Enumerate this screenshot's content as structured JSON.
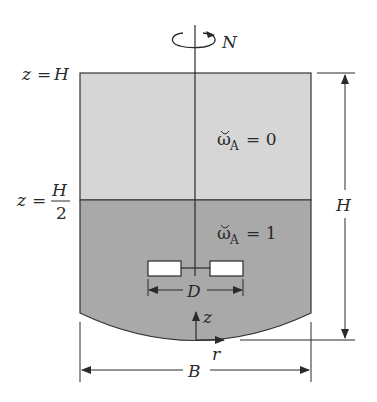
{
  "figure": {
    "rotation_label": "N",
    "top_level_label": {
      "var": "z",
      "eq": "=",
      "value": "H"
    },
    "mid_level_label": {
      "var": "z",
      "eq": "=",
      "num": "H",
      "den": "2"
    },
    "upper_region": {
      "symbol": "ω",
      "subscript": "A",
      "eq": "= 0",
      "fill": "#d6d6d6"
    },
    "lower_region": {
      "symbol": "ω",
      "subscript": "A",
      "eq": "= 1",
      "fill": "#a9a9a9"
    },
    "impeller_dim_label": "D",
    "height_dim_label": "H",
    "width_dim_label": "B",
    "axis_z_label": "z",
    "axis_r_label": "r"
  }
}
